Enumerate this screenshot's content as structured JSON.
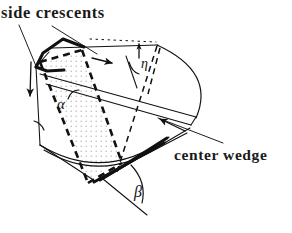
{
  "figure": {
    "type": "technical-line-diagram",
    "width": 292,
    "height": 233,
    "background_color": "#ffffff",
    "ink_color": "#111111",
    "stipple_color": "#b9b9b9"
  },
  "labels": {
    "side_crescents": "side crescents",
    "center_wedge": "center wedge"
  },
  "angles": {
    "alpha": "α",
    "beta": "β",
    "eta": "η"
  },
  "annotations": {
    "leader_side_crescents_count": 2,
    "leader_center_wedge_count": 1,
    "arrow_top_direction": "right-down along upper edge",
    "arrow_left_direction": "down-left into side crescent",
    "arrow_center_direction": "up-left toward center wedge",
    "arrow_eta_direction": "up, vertical tick"
  },
  "geometry": {
    "thick_crescent_top_left": [
      [
        36,
        67
      ],
      [
        42,
        53
      ],
      [
        63,
        39
      ],
      [
        84,
        47
      ],
      [
        69,
        61
      ],
      [
        63,
        71
      ],
      [
        46,
        72
      ]
    ],
    "thick_crescent_bottom_right": [
      [
        93,
        182
      ],
      [
        116,
        169
      ],
      [
        149,
        150
      ],
      [
        166,
        139
      ],
      [
        163,
        148
      ],
      [
        134,
        166
      ],
      [
        109,
        180
      ]
    ],
    "body_outline": [
      [
        36,
        67
      ],
      [
        63,
        39
      ],
      [
        84,
        47
      ],
      [
        196,
        116
      ],
      [
        187,
        131
      ],
      [
        93,
        182
      ],
      [
        40,
        145
      ],
      [
        36,
        67
      ]
    ],
    "dashed_plane": [
      [
        40,
        62
      ],
      [
        82,
        50
      ],
      [
        122,
        163
      ],
      [
        88,
        183
      ]
    ],
    "stipple_region": [
      [
        41,
        63
      ],
      [
        82,
        52
      ],
      [
        121,
        161
      ],
      [
        89,
        180
      ]
    ],
    "end_cap_arc": {
      "start": [
        158,
        45
      ],
      "end": [
        196,
        118
      ],
      "control": [
        215,
        72
      ]
    },
    "bottom_arc": {
      "start": [
        40,
        145
      ],
      "end": [
        168,
        137
      ],
      "control": [
        103,
        183
      ]
    },
    "top_arc": {
      "start": [
        36,
        67
      ],
      "end": [
        156,
        45
      ],
      "control": [
        95,
        50
      ]
    },
    "beta_arc": {
      "start": [
        133,
        164
      ],
      "end": [
        143,
        203
      ],
      "control": [
        146,
        181
      ]
    },
    "alpha_arc": {
      "start": [
        78,
        92
      ],
      "end": [
        68,
        99
      ],
      "control": [
        70,
        91
      ]
    },
    "eta_arc": {
      "start": [
        130,
        64
      ],
      "end": [
        139,
        72
      ],
      "control": [
        131,
        72
      ]
    }
  }
}
